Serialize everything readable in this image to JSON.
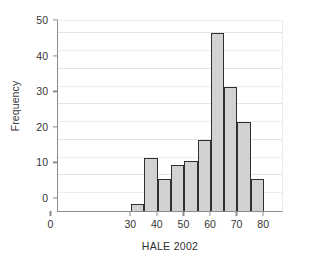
{
  "chart_data": {
    "type": "bar",
    "title": "",
    "subtitle": "",
    "xlabel": "HALE 2002",
    "ylabel": "Frequency",
    "xlim": [
      0,
      85
    ],
    "ylim": [
      0,
      54
    ],
    "grid": true,
    "legend": null,
    "bin_width": 5,
    "xticks": [
      0,
      30,
      40,
      50,
      60,
      70,
      80
    ],
    "xtick_labels": [
      "0",
      "30",
      "40",
      "50",
      "60",
      "70",
      "80"
    ],
    "yticks": [
      0,
      10,
      20,
      30,
      40,
      50
    ],
    "ytick_labels": [
      "0",
      "10",
      "20",
      "30",
      "40",
      "50"
    ],
    "y_minor_gridlines": [
      5,
      15,
      25,
      35,
      45
    ],
    "bin_edges": [
      27.5,
      32.5,
      37.5,
      42.5,
      47.5,
      52.5,
      57.5,
      62.5,
      67.5,
      72.5,
      77.5
    ],
    "categories": [
      "27.5-32.5",
      "32.5-37.5",
      "37.5-42.5",
      "42.5-47.5",
      "47.5-52.5",
      "52.5-57.5",
      "57.5-62.5",
      "62.5-67.5",
      "67.5-72.5",
      "72.5-77.5"
    ],
    "values": [
      2,
      15,
      9,
      13,
      14,
      20,
      50,
      35,
      25,
      9
    ],
    "bars": [
      {
        "x0": 27.5,
        "x1": 32.5,
        "value": 2
      },
      {
        "x0": 32.5,
        "x1": 37.5,
        "value": 15
      },
      {
        "x0": 37.5,
        "x1": 42.5,
        "value": 9
      },
      {
        "x0": 42.5,
        "x1": 47.5,
        "value": 13
      },
      {
        "x0": 47.5,
        "x1": 52.5,
        "value": 14
      },
      {
        "x0": 52.5,
        "x1": 57.5,
        "value": 20
      },
      {
        "x0": 57.5,
        "x1": 62.5,
        "value": 50
      },
      {
        "x0": 62.5,
        "x1": 67.5,
        "value": 35
      },
      {
        "x0": 67.5,
        "x1": 72.5,
        "value": 25
      },
      {
        "x0": 72.5,
        "x1": 77.5,
        "value": 9
      }
    ],
    "colors": {
      "bar_fill": "#d2d2d2",
      "bar_edge": "#2f2f2f",
      "grid": "#ededed",
      "axis": "#8c8c8c",
      "text": "#333333",
      "background": "#ffffff"
    }
  }
}
